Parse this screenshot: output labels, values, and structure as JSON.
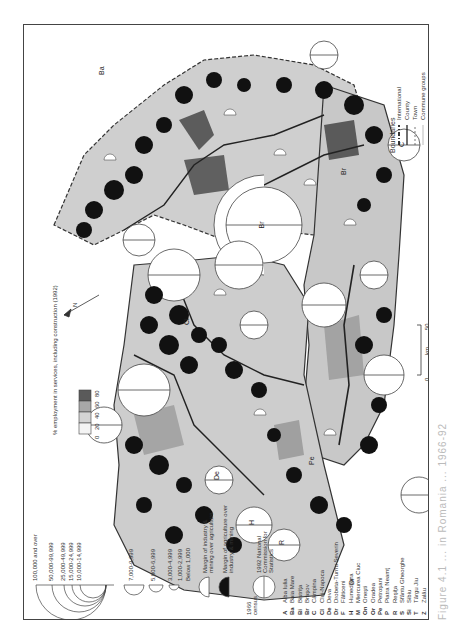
{
  "map": {
    "title_caption": "Figure 4.1 ... in Romania ... 1966-92",
    "orientation": "rotated 90° counter-clockwise",
    "north_arrow_label": "N",
    "scale_bar": {
      "start": "0",
      "unit": "km",
      "end": "50"
    },
    "boundaries_legend": {
      "title": "Boundaries",
      "items": [
        "International",
        "County",
        "Town",
        "Commune groups"
      ]
    },
    "population_legend": {
      "classes": [
        "100,000 and over",
        "50,000-99,999",
        "25,000-49,999",
        "15,000-24,999",
        "10,000-14,999",
        "7,000-9,999",
        "5,000-6,999",
        "3,000-4,999",
        "1,000-2,999",
        "Below 1,000"
      ]
    },
    "margin_legend": {
      "white": "Margin of industry & mining over agriculture",
      "black": "Margin of agriculture over industry & mining"
    },
    "census_legend": {
      "left": "1966 census",
      "right": "1992 National Commission for Statistics"
    },
    "services_legend": {
      "title": "% employment in services, including construction (1992)",
      "ticks": [
        "80",
        "60",
        "40",
        "20",
        "0"
      ],
      "colors": [
        "#5a5a5a",
        "#a8a8a8",
        "#d4d4d4",
        "#f4f4f4"
      ]
    },
    "towns": [
      {
        "code": "A",
        "name": "Alba Iulia"
      },
      {
        "code": "Ba",
        "name": "Baia Mare"
      },
      {
        "code": "Bi",
        "name": "Bistriţa"
      },
      {
        "code": "Br",
        "name": "Braşov"
      },
      {
        "code": "C",
        "name": "Câmpina"
      },
      {
        "code": "Cl",
        "name": "Cluj-Napoca"
      },
      {
        "code": "De",
        "name": "Deva"
      },
      {
        "code": "Dr",
        "name": "Drobeta-Turnu Severin"
      },
      {
        "code": "F",
        "name": "Fălticeni"
      },
      {
        "code": "H",
        "name": "Hunedoara"
      },
      {
        "code": "M",
        "name": "Miercurea Ciuc"
      },
      {
        "code": "On",
        "name": "Oneşti"
      },
      {
        "code": "Or",
        "name": "Oradea"
      },
      {
        "code": "Pe",
        "name": "Petroşani"
      },
      {
        "code": "P",
        "name": "Piatra Neamţ"
      },
      {
        "code": "R",
        "name": "Reşiţa"
      },
      {
        "code": "S",
        "name": "Sfântu Gheorghe"
      },
      {
        "code": "Si",
        "name": "Sibiu"
      },
      {
        "code": "T",
        "name": "Târgu Jiu"
      },
      {
        "code": "Z",
        "name": "Zalău"
      }
    ],
    "map_labels": [
      "Br",
      "Ba",
      "Bi",
      "Cl",
      "Z",
      "Or",
      "De",
      "H",
      "R",
      "Pe",
      "Dr",
      "A",
      "Si",
      "S",
      "M",
      "On",
      "C",
      "P",
      "F",
      "T"
    ]
  }
}
